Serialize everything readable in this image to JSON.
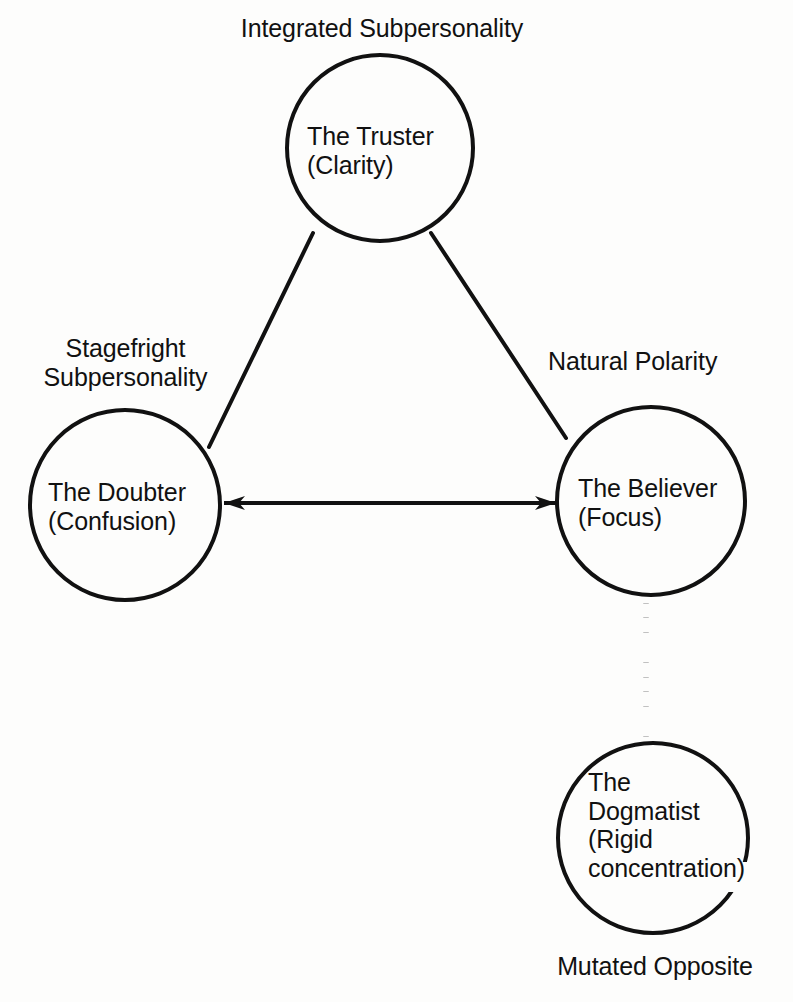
{
  "diagram": {
    "background_color": "#fdfdfc",
    "stroke_color": "#111111",
    "nodes": [
      {
        "id": "truster",
        "name": "The Truster",
        "quality": "(Clarity)",
        "label_line1": "The Truster",
        "label_line2": "(Clarity)",
        "annotation": "Integrated Subpersonality",
        "cx": 380,
        "cy": 148,
        "r": 93
      },
      {
        "id": "doubter",
        "name": "The Doubter",
        "quality": "(Confusion)",
        "label_line1": "The Doubter",
        "label_line2": "(Confusion)",
        "annotation_line1": "Stagefright",
        "annotation_line2": "Subpersonality",
        "cx": 125,
        "cy": 505,
        "r": 95
      },
      {
        "id": "believer",
        "name": "The Believer",
        "quality": "(Focus)",
        "label_line1": "The Believer",
        "label_line2": "(Focus)",
        "annotation": "Natural Polarity",
        "cx": 651,
        "cy": 501,
        "r": 94
      },
      {
        "id": "dogmatist",
        "name": "The Dogmatist",
        "quality": "(Rigid concentration)",
        "label_line1": "The",
        "label_line2": "Dogmatist",
        "label_line3": "(Rigid",
        "label_line4": "concentration)",
        "annotation": "Mutated Opposite",
        "cx": 653,
        "cy": 838,
        "r": 95
      }
    ],
    "edges": [
      {
        "id": "truster-doubter",
        "from": "truster",
        "to": "doubter",
        "style": "solid",
        "arrows": "none"
      },
      {
        "id": "truster-believer",
        "from": "truster",
        "to": "believer",
        "style": "solid",
        "arrows": "none"
      },
      {
        "id": "doubter-believer",
        "from": "doubter",
        "to": "believer",
        "style": "solid",
        "arrows": "both",
        "label": "Natural Polarity"
      },
      {
        "id": "believer-dogmatist",
        "from": "believer",
        "to": "dogmatist",
        "style": "dotted",
        "arrows": "none",
        "label": "Mutated Opposite"
      }
    ],
    "annotations": {
      "integrated": "Integrated Subpersonality",
      "stagefright_line1": "Stagefright",
      "stagefright_line2": "Subpersonality",
      "natural_polarity": "Natural Polarity",
      "mutated_opposite": "Mutated Opposite"
    }
  }
}
